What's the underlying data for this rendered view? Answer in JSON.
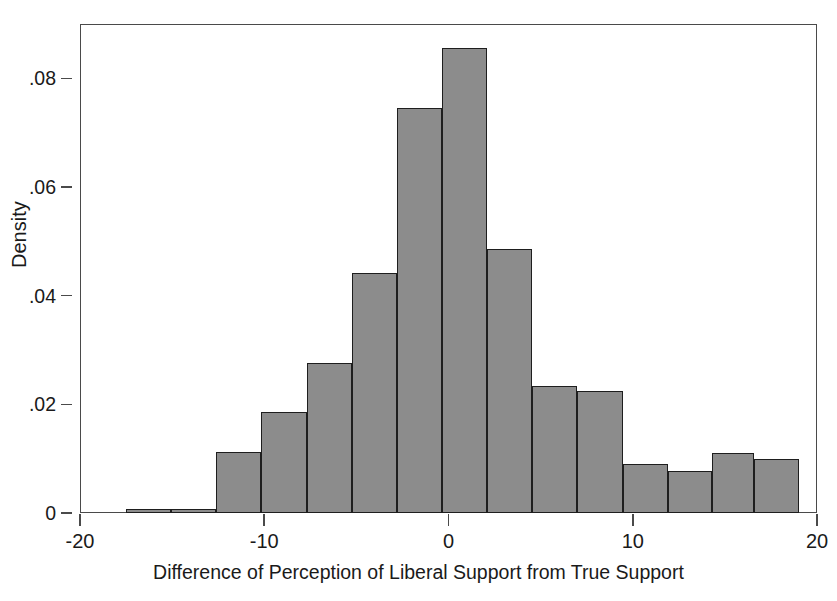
{
  "chart_data": {
    "type": "bar",
    "subtype": "histogram",
    "title": "",
    "xlabel": "Difference of Perception of Liberal Support from True Support",
    "ylabel": "Density",
    "xlim": [
      -20,
      20
    ],
    "ylim": [
      0,
      0.09
    ],
    "grid": false,
    "legend": null,
    "bar_color": "#8c8c8c",
    "bar_edge_color": "#1e1e1e",
    "axis_color": "#4a4a4a",
    "background": "#ffffff",
    "xticks": [
      -20,
      -10,
      0,
      10,
      20
    ],
    "xtick_labels": [
      "-20",
      "-10",
      "0",
      "10",
      "20"
    ],
    "yticks": [
      0,
      0.02,
      0.04,
      0.06,
      0.08
    ],
    "ytick_labels": [
      "0",
      ".02",
      ".04",
      ".06",
      ".08"
    ],
    "bin_width": 2.46,
    "bin_edges": [
      -17.5,
      -15.05,
      -12.6,
      -10.15,
      -7.7,
      -5.25,
      -2.8,
      -0.35,
      2.1,
      4.55,
      7.0,
      9.46,
      11.92,
      14.3,
      16.6,
      19.0
    ],
    "bins": [
      {
        "label": "-17.5 to -15.1",
        "x0": -17.5,
        "x1": -15.05,
        "density": 0.0008
      },
      {
        "label": "-15.1 to -12.6",
        "x0": -15.05,
        "x1": -12.6,
        "density": 0.0008
      },
      {
        "label": "-12.6 to -10.2",
        "x0": -12.6,
        "x1": -10.15,
        "density": 0.0113
      },
      {
        "label": "-10.2 to -7.7",
        "x0": -10.15,
        "x1": -7.7,
        "density": 0.0186
      },
      {
        "label": "-7.7 to -5.3",
        "x0": -7.7,
        "x1": -5.25,
        "density": 0.0277
      },
      {
        "label": "-5.3 to -2.8",
        "x0": -5.25,
        "x1": -2.8,
        "density": 0.0442
      },
      {
        "label": "-2.8 to -0.4",
        "x0": -2.8,
        "x1": -0.35,
        "density": 0.0745
      },
      {
        "label": "-0.4 to 2.1",
        "x0": -0.35,
        "x1": 2.1,
        "density": 0.0855
      },
      {
        "label": "2.1 to 4.6",
        "x0": 2.1,
        "x1": 4.55,
        "density": 0.0485
      },
      {
        "label": "4.6 to 7.0",
        "x0": 4.55,
        "x1": 7.0,
        "density": 0.0233
      },
      {
        "label": "7.0 to 9.5",
        "x0": 7.0,
        "x1": 9.46,
        "density": 0.0224
      },
      {
        "label": "9.5 to 11.9",
        "x0": 9.46,
        "x1": 11.92,
        "density": 0.0091
      },
      {
        "label": "11.9 to 14.3",
        "x0": 11.92,
        "x1": 14.3,
        "density": 0.0077
      },
      {
        "label": "14.3 to 16.6",
        "x0": 14.3,
        "x1": 16.6,
        "density": 0.011
      },
      {
        "label": "16.6 to 19.0",
        "x0": 16.6,
        "x1": 19.0,
        "density": 0.01
      }
    ]
  }
}
